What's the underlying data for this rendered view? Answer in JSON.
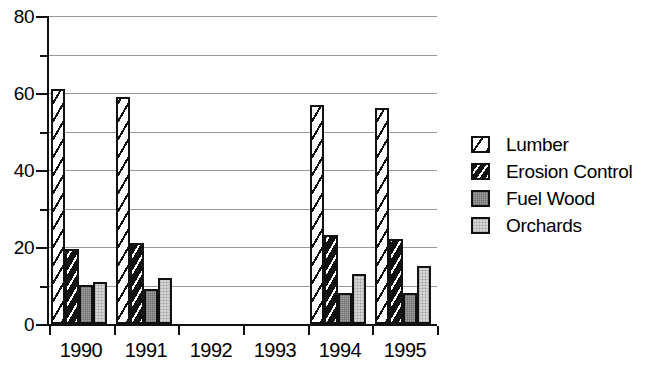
{
  "chart_data": {
    "type": "bar",
    "title": "",
    "subtitle": "",
    "xlabel": "",
    "ylabel": "",
    "categories": [
      "1990",
      "1991",
      "1992",
      "1993",
      "1994",
      "1995"
    ],
    "series": [
      {
        "name": "Lumber",
        "values": [
          61,
          59,
          0,
          0,
          57,
          56
        ]
      },
      {
        "name": "Erosion Control",
        "values": [
          19.5,
          21,
          0,
          0,
          23,
          22
        ]
      },
      {
        "name": "Fuel Wood",
        "values": [
          10,
          9,
          0,
          0,
          8,
          8
        ]
      },
      {
        "name": "Orchards",
        "values": [
          11,
          12,
          0,
          0,
          13,
          15
        ]
      }
    ],
    "ylim": [
      0,
      80
    ],
    "y_major_ticks": [
      0,
      20,
      40,
      60,
      80
    ],
    "y_major_tick_labels": [
      "0",
      "20",
      "40",
      "60",
      "80"
    ],
    "y_minor_ticks": [
      10,
      30,
      50,
      70
    ],
    "gridlines": [
      10,
      20,
      30,
      40,
      50,
      60,
      70,
      80
    ],
    "grid": true,
    "grid_color": "#9a9a9a",
    "legend_position": "right",
    "swatch_patterns": [
      "diagonal-hatch-light",
      "diagonal-hatch-dark",
      "solid-gray",
      "solid-light-gray"
    ],
    "colors": {
      "lumber": "#ffffff",
      "erosion_control": "#111111",
      "fuel_wood": "#a0a0a0",
      "orchards": "#d6d6d6",
      "axis": "#111111",
      "grid": "#9a9a9a",
      "background": "#ffffff"
    }
  },
  "legend": {
    "items": [
      {
        "label": "Lumber"
      },
      {
        "label": "Erosion Control"
      },
      {
        "label": "Fuel Wood"
      },
      {
        "label": "Orchards"
      }
    ]
  }
}
